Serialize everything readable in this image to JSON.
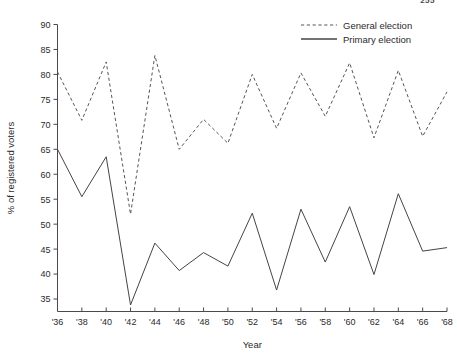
{
  "page": {
    "number": "255"
  },
  "chart_data": {
    "type": "line",
    "title": "",
    "xlabel": "Year",
    "ylabel": "% of registered voters",
    "categories": [
      "'36",
      "'38",
      "'40",
      "'42",
      "'44",
      "'46",
      "'48",
      "'50",
      "'52",
      "'54",
      "'56",
      "'58",
      "'60",
      "'62",
      "'64",
      "'66",
      "'68"
    ],
    "x": [
      1936,
      1938,
      1940,
      1942,
      1944,
      1946,
      1948,
      1950,
      1952,
      1954,
      1956,
      1958,
      1960,
      1962,
      1964,
      1966,
      1968
    ],
    "xlim": [
      1936,
      1968
    ],
    "ylim": [
      32.5,
      90
    ],
    "yticks": [
      35,
      40,
      45,
      50,
      55,
      60,
      65,
      70,
      75,
      80,
      85,
      90
    ],
    "ytick_labels": [
      "35",
      "40",
      "45",
      "50",
      "55",
      "60",
      "65",
      "70",
      "75",
      "80",
      "85",
      "90"
    ],
    "grid": false,
    "legend_position": "top-right",
    "series": [
      {
        "name": "General election",
        "style": "dashed",
        "color": "#555555",
        "values": [
          80.5,
          70.8,
          82.5,
          52.0,
          83.8,
          65.0,
          71.0,
          66.2,
          80.0,
          69.2,
          80.3,
          71.6,
          82.3,
          67.3,
          80.8,
          67.6,
          76.5
        ]
      },
      {
        "name": "Primary election",
        "style": "solid",
        "color": "#444444",
        "values": [
          65.0,
          55.5,
          63.5,
          33.8,
          46.2,
          40.7,
          44.3,
          41.6,
          52.2,
          36.8,
          53.0,
          42.4,
          53.5,
          39.9,
          56.1,
          44.6,
          45.3
        ]
      }
    ]
  },
  "legend": {
    "items": [
      {
        "label": "General election",
        "style": "dashed"
      },
      {
        "label": "Primary election",
        "style": "solid"
      }
    ]
  }
}
